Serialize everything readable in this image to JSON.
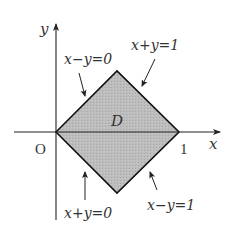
{
  "diagram": {
    "axes": {
      "x_label": "x",
      "y_label": "y",
      "origin_label": "O",
      "x_tick_label": "1"
    },
    "region": {
      "label": "D",
      "vertices": [
        [
          0,
          0
        ],
        [
          0.5,
          0.5
        ],
        [
          1,
          0
        ],
        [
          0.5,
          -0.5
        ]
      ],
      "fill_color": "#b9b9b9",
      "stroke_color": "#111111"
    },
    "boundary_labels": {
      "upper_left": "x−y=0",
      "upper_right": "x+y=1",
      "lower_left": "x+y=0",
      "lower_right": "x−y=1"
    }
  }
}
